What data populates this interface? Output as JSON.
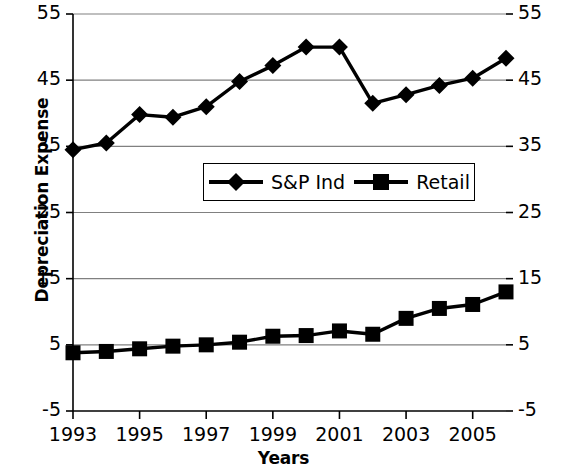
{
  "chart_data": {
    "type": "line",
    "title": "",
    "xlabel": "Years",
    "ylabel": "Depreciation Expense",
    "x": [
      1993,
      1994,
      1995,
      1996,
      1997,
      1998,
      1999,
      2000,
      2001,
      2002,
      2003,
      2004,
      2005,
      2006
    ],
    "categories": [
      "1993",
      "1994",
      "1995",
      "1996",
      "1997",
      "1998",
      "1999",
      "2000",
      "2001",
      "2002",
      "2003",
      "2004",
      "2005",
      "2006"
    ],
    "series": [
      {
        "name": "S&P Ind",
        "marker": "diamond",
        "values": [
          34.5,
          35.5,
          39.8,
          39.4,
          41.0,
          44.8,
          47.2,
          50.0,
          50.0,
          41.5,
          42.8,
          44.2,
          45.3,
          48.3
        ]
      },
      {
        "name": "Retail",
        "marker": "square",
        "values": [
          3.8,
          4.0,
          4.4,
          4.8,
          5.0,
          5.4,
          6.3,
          6.4,
          7.1,
          6.6,
          9.0,
          10.5,
          11.1,
          13.0
        ]
      }
    ],
    "xlim": [
      1993,
      2006
    ],
    "ylim": [
      -5,
      55
    ],
    "ytick_values": [
      55,
      45,
      35,
      25,
      15,
      5,
      -5
    ],
    "ytick_labels_left": [
      "55",
      "45",
      "35",
      "25",
      "15",
      "5",
      "-5"
    ],
    "ytick_labels_right": [
      "55",
      "45",
      "35",
      "25",
      "15",
      "5",
      "-5"
    ],
    "xtick_values": [
      1993,
      1995,
      1997,
      1999,
      2001,
      2003,
      2005
    ],
    "xtick_labels": [
      "1993",
      "1995",
      "1997",
      "1999",
      "2001",
      "2003",
      "2005"
    ],
    "grid": true,
    "grid_axis": "y",
    "legend": {
      "position": "center",
      "entries": [
        {
          "label": "S&P Ind",
          "marker": "diamond"
        },
        {
          "label": "Retail",
          "marker": "square"
        }
      ]
    },
    "colors": {
      "series": "#000000",
      "grid": "#808080",
      "axis": "#000000",
      "background": "#ffffff"
    }
  }
}
